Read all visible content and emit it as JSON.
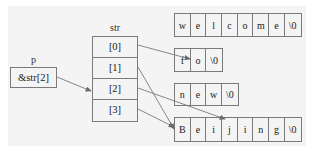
{
  "diagram": {
    "pointer": {
      "name": "p",
      "value": "&str[2]"
    },
    "array": {
      "name": "str",
      "cells": [
        "[0]",
        "[1]",
        "[2]",
        "[3]"
      ]
    },
    "strings": [
      {
        "id": "welcome",
        "chars": [
          "w",
          "e",
          "l",
          "c",
          "o",
          "m",
          "e",
          "\\0"
        ]
      },
      {
        "id": "fo",
        "chars": [
          "f",
          "o",
          "\\0"
        ]
      },
      {
        "id": "new",
        "chars": [
          "n",
          "e",
          "w",
          "\\0"
        ]
      },
      {
        "id": "beijing",
        "chars": [
          "B",
          "e",
          "i",
          "j",
          "i",
          "n",
          "g",
          "\\0"
        ]
      }
    ],
    "edges": [
      {
        "from": "p",
        "to": "str[2]"
      },
      {
        "from": "str[0]",
        "to": "fo[0]"
      },
      {
        "from": "str[1]",
        "to": "beijing[0]"
      },
      {
        "from": "str[2]",
        "to": "beijing[3]"
      },
      {
        "from": "str[3]",
        "to": "beijing[0]"
      }
    ],
    "colors": {
      "line": "#7a7a7a",
      "panel": "#f4f4f4",
      "text": "#222222"
    }
  }
}
